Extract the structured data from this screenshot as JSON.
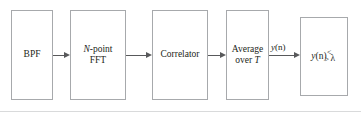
{
  "figure": {
    "type": "block-diagram",
    "title": "",
    "orientation": "left-to-right",
    "background_color": "#ffffff",
    "box_border_color": "#a7a9ac",
    "arrow_color": "#58595b",
    "text_color": "#231f20",
    "rule_color": "#d9dadb"
  },
  "blocks": [
    {
      "id": "bpf",
      "line1": "BPF",
      "line2": "",
      "x": 11,
      "y": 10,
      "w": 42,
      "h": 90
    },
    {
      "id": "fft",
      "line1_italic": "N",
      "line1_rest": "-point",
      "line2": "FFT",
      "x": 70,
      "y": 10,
      "w": 56,
      "h": 90
    },
    {
      "id": "correlator",
      "line1": "Correlator",
      "line2": "",
      "x": 152,
      "y": 10,
      "w": 56,
      "h": 90
    },
    {
      "id": "average",
      "line1": "Average",
      "line2_rest": "over ",
      "line2_italic": "T",
      "x": 226,
      "y": 10,
      "w": 43,
      "h": 90
    },
    {
      "id": "threshold",
      "compare_value_italic": "y",
      "compare_value_paren": "(n)",
      "compare_less": "<",
      "compare_greater": ">",
      "compare_threshold": "λ",
      "x": 300,
      "y": 17,
      "w": 48,
      "h": 79
    }
  ],
  "arrows": [
    {
      "id": "bpf-to-fft",
      "x": 53,
      "y": 55,
      "w": 17
    },
    {
      "id": "fft-to-correlator",
      "x": 126,
      "y": 55,
      "w": 26
    },
    {
      "id": "correlator-to-average",
      "x": 208,
      "y": 55,
      "w": 18
    },
    {
      "id": "average-to-threshold",
      "x": 269,
      "y": 55,
      "w": 31
    }
  ],
  "edge_labels": [
    {
      "id": "yn-signal",
      "italic": "y",
      "paren": "(n)",
      "x": 271,
      "y": 42
    }
  ],
  "rules": [
    {
      "id": "bottom-rule",
      "y": 111
    }
  ]
}
